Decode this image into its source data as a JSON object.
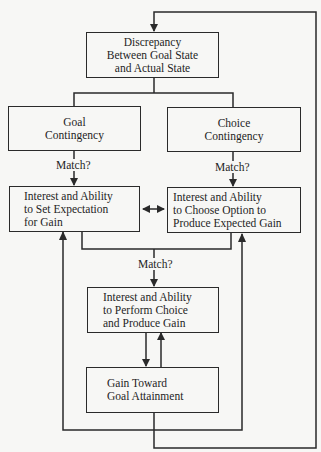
{
  "diagram": {
    "nodes": {
      "discrepancy": {
        "lines": [
          "Discrepancy",
          "Between Goal State",
          "and Actual State"
        ]
      },
      "goal_contingency": {
        "lines": [
          "Goal",
          "Contingency"
        ]
      },
      "choice_contingency": {
        "lines": [
          "Choice",
          "Contingency"
        ]
      },
      "set_expectation": {
        "lines": [
          "Interest and Ability",
          "to Set Expectation",
          "for Gain"
        ]
      },
      "choose_option": {
        "lines": [
          "Interest and Ability",
          "to Choose Option to",
          "Produce Expected Gain"
        ]
      },
      "perform_choice": {
        "lines": [
          "Interest and Ability",
          "to Perform Choice",
          "and Produce Gain"
        ]
      },
      "gain": {
        "lines": [
          "Gain Toward",
          "Goal Attainment"
        ]
      }
    },
    "edge_labels": {
      "goal_match": "Match?",
      "choice_match": "Match?",
      "center_match": "Match?"
    },
    "colors": {
      "line": "#2a2a2a",
      "background": "#f7f7f5",
      "text": "#1e1e1e"
    }
  }
}
